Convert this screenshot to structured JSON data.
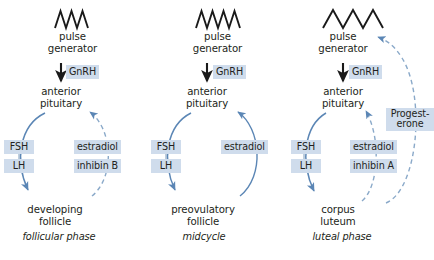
{
  "figure": {
    "background_color": "#ffffff",
    "chip_color": "#cfdcec",
    "arrow_color": "#5b86b5",
    "text_color": "#231f20",
    "width": 434,
    "height": 260
  },
  "common": {
    "pulse_generator_label": "pulse\ngenerator",
    "pulse_generator_line1": "pulse",
    "pulse_generator_line2": "generator",
    "anterior_pituitary_line1": "anterior",
    "anterior_pituitary_line2": "pituitary",
    "gnrh_label": "GnRH",
    "fsh_label": "FSH",
    "lh_label": "LH"
  },
  "panels": [
    {
      "id": "follicular",
      "pulse_wave": {
        "peaks": 2,
        "frequency": "high",
        "points": "0,14 4,0 8,14 12,0 16,14 20,0 24,14"
      },
      "pulse_generator_line1": "pulse",
      "pulse_generator_line2": "generator",
      "gnrh_label": "GnRH",
      "anterior_pituitary_line1": "anterior",
      "anterior_pituitary_line2": "pituitary",
      "gonadotropins": [
        "FSH",
        "LH"
      ],
      "feedback_hormones": [
        "estradiol",
        "inhibin B"
      ],
      "feedback_type": "negative",
      "feedback_line_style": "dashed",
      "feedback_targets": [
        "anterior pituitary"
      ],
      "target_line1": "developing",
      "target_line2": "follicle",
      "phase_label": "follicular phase"
    },
    {
      "id": "midcycle",
      "pulse_wave": {
        "peaks": 3,
        "frequency": "high",
        "points": "0,14 4,0 8,14 12,0 16,14 20,0 24,14"
      },
      "pulse_generator_line1": "pulse",
      "pulse_generator_line2": "generator",
      "gnrh_label": "GnRH",
      "anterior_pituitary_line1": "anterior",
      "anterior_pituitary_line2": "pituitary",
      "gonadotropins": [
        "FSH",
        "LH"
      ],
      "feedback_hormones": [
        "estradiol"
      ],
      "feedback_type": "positive",
      "feedback_line_style": "solid",
      "feedback_targets": [
        "anterior pituitary"
      ],
      "target_line1": "preovulatory",
      "target_line2": "follicle",
      "phase_label": "midcycle"
    },
    {
      "id": "luteal",
      "pulse_wave": {
        "peaks": 3,
        "frequency": "low",
        "points": "0,14 7,0 14,14 21,0 28,14 35,0 42,14"
      },
      "pulse_generator_line1": "pulse",
      "pulse_generator_line2": "generator",
      "gnrh_label": "GnRH",
      "anterior_pituitary_line1": "anterior",
      "anterior_pituitary_line2": "pituitary",
      "gonadotropins": [
        "FSH",
        "LH"
      ],
      "feedback_hormones": [
        "estradiol",
        "inhibin A"
      ],
      "progesterone_line1": "Progest-",
      "progesterone_line2": "erone",
      "feedback_type": "negative",
      "feedback_line_style": "dashed",
      "feedback_targets": [
        "anterior pituitary",
        "pulse generator"
      ],
      "target_line1": "corpus",
      "target_line2": "luteum",
      "phase_label": "luteal phase"
    }
  ],
  "caption": {
    "clipped_text": ""
  }
}
